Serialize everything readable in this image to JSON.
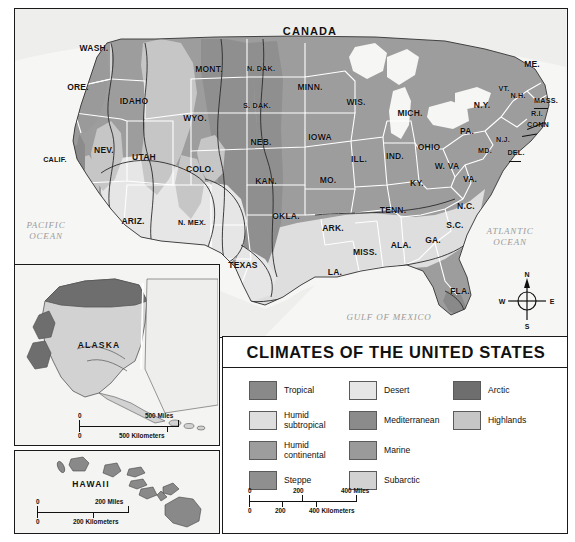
{
  "map": {
    "country_label": "CANADA",
    "oceans": [
      {
        "name": "pacific-ocean-label",
        "text": "PACIFIC\nOCEAN",
        "x": 46,
        "y": 231
      },
      {
        "name": "atlantic-ocean-label",
        "text": "ATLANTIC\nOCEAN",
        "x": 510,
        "y": 237
      },
      {
        "name": "gulf-of-mexico-label",
        "text": "GULF OF MEXICO",
        "x": 389,
        "y": 317
      }
    ],
    "states": [
      {
        "abbr": "WASH.",
        "x": 94,
        "y": 48
      },
      {
        "abbr": "ORE.",
        "x": 78,
        "y": 87
      },
      {
        "abbr": "IDAHO",
        "x": 134,
        "y": 101
      },
      {
        "abbr": "MONT.",
        "x": 209,
        "y": 69
      },
      {
        "abbr": "N. DAK.",
        "x": 261,
        "y": 68
      },
      {
        "abbr": "MINN.",
        "x": 310,
        "y": 87
      },
      {
        "abbr": "WIS.",
        "x": 356,
        "y": 102
      },
      {
        "abbr": "MICH.",
        "x": 410,
        "y": 113
      },
      {
        "abbr": "WYO.",
        "x": 195,
        "y": 118
      },
      {
        "abbr": "S. DAK.",
        "x": 257,
        "y": 105
      },
      {
        "abbr": "NEB.",
        "x": 261,
        "y": 142
      },
      {
        "abbr": "IOWA",
        "x": 320,
        "y": 137
      },
      {
        "abbr": "NEV.",
        "x": 104,
        "y": 150
      },
      {
        "abbr": "UTAH",
        "x": 144,
        "y": 157
      },
      {
        "abbr": "COLO.",
        "x": 200,
        "y": 169
      },
      {
        "abbr": "KAN.",
        "x": 266,
        "y": 181
      },
      {
        "abbr": "MO.",
        "x": 328,
        "y": 180
      },
      {
        "abbr": "ILL.",
        "x": 359,
        "y": 159
      },
      {
        "abbr": "IND.",
        "x": 395,
        "y": 156
      },
      {
        "abbr": "OHIO",
        "x": 429,
        "y": 147
      },
      {
        "abbr": "CALIF.",
        "x": 55,
        "y": 159
      },
      {
        "abbr": "ARIZ.",
        "x": 133,
        "y": 221
      },
      {
        "abbr": "N. MEX.",
        "x": 192,
        "y": 222
      },
      {
        "abbr": "OKLA.",
        "x": 286,
        "y": 216
      },
      {
        "abbr": "ARK.",
        "x": 333,
        "y": 228
      },
      {
        "abbr": "TENN.",
        "x": 393,
        "y": 210
      },
      {
        "abbr": "KY.",
        "x": 417,
        "y": 183
      },
      {
        "abbr": "W. VA",
        "x": 447,
        "y": 166
      },
      {
        "abbr": "VA.",
        "x": 470,
        "y": 179
      },
      {
        "abbr": "N.C.",
        "x": 466,
        "y": 206
      },
      {
        "abbr": "S.C.",
        "x": 455,
        "y": 225
      },
      {
        "abbr": "GA.",
        "x": 433,
        "y": 240
      },
      {
        "abbr": "ALA.",
        "x": 401,
        "y": 245
      },
      {
        "abbr": "MISS.",
        "x": 365,
        "y": 252
      },
      {
        "abbr": "LA.",
        "x": 335,
        "y": 272
      },
      {
        "abbr": "TEXAS",
        "x": 243,
        "y": 265
      },
      {
        "abbr": "FLA.",
        "x": 460,
        "y": 291
      },
      {
        "abbr": "PA.",
        "x": 467,
        "y": 131
      },
      {
        "abbr": "N.Y.",
        "x": 482,
        "y": 105
      },
      {
        "abbr": "VT.",
        "x": 504,
        "y": 88
      },
      {
        "abbr": "N.H.",
        "x": 518,
        "y": 95
      },
      {
        "abbr": "ME.",
        "x": 532,
        "y": 64
      },
      {
        "abbr": "MASS.",
        "x": 546,
        "y": 100
      },
      {
        "abbr": "R.I.",
        "x": 537,
        "y": 113
      },
      {
        "abbr": "CONN",
        "x": 538,
        "y": 124
      },
      {
        "abbr": "N.J.",
        "x": 503,
        "y": 139
      },
      {
        "abbr": "MD.",
        "x": 485,
        "y": 150
      },
      {
        "abbr": "DEL.",
        "x": 516,
        "y": 152
      }
    ],
    "compass": {
      "n": "N",
      "e": "E",
      "s": "S",
      "w": "W"
    }
  },
  "alaska": {
    "name": "ALASKA",
    "scale": {
      "miles_zero": "0",
      "miles_value": "500 Miles",
      "km_zero": "0",
      "km_value": "500 Kilometers"
    }
  },
  "hawaii": {
    "name": "HAWAII",
    "scale": {
      "miles_zero": "0",
      "miles_value": "200 Miles",
      "km_zero": "0",
      "km_value": "200 Kilometers"
    }
  },
  "legend": {
    "title": "CLIMATES OF THE UNITED STATES",
    "columns": [
      [
        {
          "label": "Tropical",
          "color": "#898989"
        },
        {
          "label": "Humid\nsubtropical",
          "color": "#dedede"
        },
        {
          "label": "Humid\ncontinental",
          "color": "#9d9d9d"
        },
        {
          "label": "Steppe",
          "color": "#8f8f8f"
        }
      ],
      [
        {
          "label": "Desert",
          "color": "#e6e6e6"
        },
        {
          "label": "Mediterranean",
          "color": "#8b8b8b"
        },
        {
          "label": "Marine",
          "color": "#9a9a9a"
        },
        {
          "label": "Subarctic",
          "color": "#d2d2d2"
        }
      ],
      [
        {
          "label": "Arctic",
          "color": "#6e6e6e"
        },
        {
          "label": "Highlands",
          "color": "#c6c6c6"
        }
      ]
    ],
    "scale": {
      "miles_ticks": [
        "0",
        "200",
        "400 Miles"
      ],
      "km_ticks": [
        "0",
        "200",
        "400 Kilometers"
      ]
    }
  },
  "chart_data": {
    "type": "map",
    "title": "CLIMATES OF THE UNITED STATES",
    "classes": [
      "Tropical",
      "Humid subtropical",
      "Humid continental",
      "Steppe",
      "Desert",
      "Mediterranean",
      "Marine",
      "Subarctic",
      "Arctic",
      "Highlands"
    ],
    "regions": [
      {
        "region": "Alaska north slope",
        "climate": "Arctic"
      },
      {
        "region": "Alaska interior/south",
        "climate": "Subarctic"
      },
      {
        "region": "Hawaii",
        "climate": "Tropical"
      },
      {
        "region": "Southern Florida",
        "climate": "Tropical"
      },
      {
        "region": "Southeast US",
        "climate": "Humid subtropical"
      },
      {
        "region": "Northeast / Upper Midwest",
        "climate": "Humid continental"
      },
      {
        "region": "Great Plains",
        "climate": "Steppe"
      },
      {
        "region": "Southwest interior",
        "climate": "Desert"
      },
      {
        "region": "Coastal California",
        "climate": "Mediterranean"
      },
      {
        "region": "Pacific Northwest coast",
        "climate": "Marine"
      },
      {
        "region": "Rocky Mountains / Sierra Nevada",
        "climate": "Highlands"
      }
    ]
  }
}
